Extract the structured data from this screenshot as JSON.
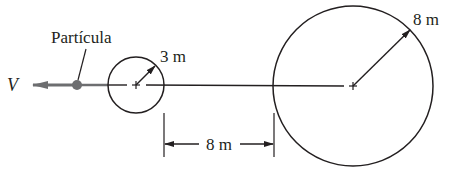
{
  "diagram": {
    "particle_label": "Partícula",
    "velocity_label": "V",
    "small_circle_radius_label": "3 m",
    "large_circle_radius_label": "8 m",
    "gap_distance_label": "8 m"
  },
  "colors": {
    "ink": "#231f20",
    "particle": "#6d6e70",
    "velocity_arrow": "#6d6e70"
  }
}
